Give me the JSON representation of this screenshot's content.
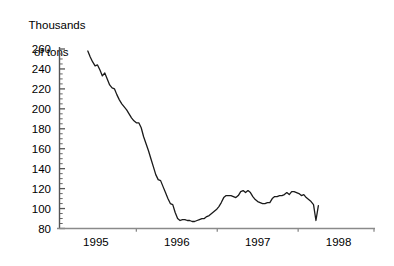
{
  "chart_data": {
    "type": "line",
    "title": "",
    "ylabel": "Thousands\nof tons",
    "ylabel_line1": "Thousands",
    "ylabel_line2": "of tons",
    "xlabel": "",
    "ylim": [
      80,
      260
    ],
    "ytick_values": [
      80,
      100,
      120,
      140,
      160,
      180,
      200,
      220,
      240,
      260
    ],
    "ytick_labels": [
      "80",
      "100",
      "120",
      "140",
      "160",
      "180",
      "200",
      "220",
      "240",
      "260"
    ],
    "y_minor_tick_step": 5,
    "xtick_labels": [
      "1995",
      "1996",
      "1997",
      "1998"
    ],
    "xtick_values": [
      1995,
      1996,
      1997,
      1998
    ],
    "xlim": [
      1994.55,
      1998.45
    ],
    "grid": false,
    "legend": null,
    "line_color": "#1a1a1a",
    "line_width": 1.3,
    "axis_color": "#555555",
    "background": "#ffffff",
    "series": [
      {
        "name": "stocks",
        "x": [
          1994.9,
          1994.93,
          1994.96,
          1994.99,
          1995.02,
          1995.05,
          1995.08,
          1995.11,
          1995.14,
          1995.17,
          1995.2,
          1995.23,
          1995.26,
          1995.29,
          1995.32,
          1995.35,
          1995.38,
          1995.41,
          1995.44,
          1995.47,
          1995.5,
          1995.53,
          1995.56,
          1995.59,
          1995.62,
          1995.65,
          1995.68,
          1995.71,
          1995.74,
          1995.77,
          1995.8,
          1995.83,
          1995.86,
          1995.89,
          1995.92,
          1995.95,
          1995.98,
          1996.01,
          1996.04,
          1996.07,
          1996.1,
          1996.13,
          1996.16,
          1996.19,
          1996.22,
          1996.25,
          1996.28,
          1996.31,
          1996.34,
          1996.37,
          1996.4,
          1996.43,
          1996.46,
          1996.49,
          1996.52,
          1996.55,
          1996.58,
          1996.61,
          1996.64,
          1996.67,
          1996.7,
          1996.73,
          1996.76,
          1996.79,
          1996.82,
          1996.85,
          1996.88,
          1996.91,
          1996.94,
          1996.97,
          1997.0,
          1997.03,
          1997.06,
          1997.09,
          1997.12,
          1997.15,
          1997.18,
          1997.21,
          1997.24,
          1997.27,
          1997.3,
          1997.33,
          1997.36,
          1997.39,
          1997.42,
          1997.45,
          1997.48,
          1997.51,
          1997.54,
          1997.57,
          1997.6,
          1997.63,
          1997.66,
          1997.69,
          1997.72,
          1997.75
        ],
        "values": [
          258,
          252,
          247,
          243,
          244,
          239,
          233,
          236,
          230,
          224,
          221,
          220,
          214,
          209,
          205,
          202,
          199,
          195,
          191,
          188,
          186,
          186,
          181,
          172,
          165,
          158,
          150,
          142,
          134,
          129,
          128,
          122,
          116,
          110,
          105,
          104,
          96,
          90,
          88,
          89,
          89,
          88,
          88,
          87,
          87,
          88,
          89,
          90,
          90,
          92,
          93,
          95,
          97,
          99,
          102,
          106,
          111,
          113,
          113,
          113,
          112,
          111,
          113,
          117,
          118,
          116,
          118,
          116,
          112,
          109,
          107,
          106,
          105,
          105,
          106,
          106,
          110,
          112,
          112,
          113,
          113,
          114,
          116,
          114,
          117,
          117,
          116,
          115,
          113,
          114,
          111,
          109,
          107,
          104,
          88,
          103
        ]
      }
    ]
  }
}
